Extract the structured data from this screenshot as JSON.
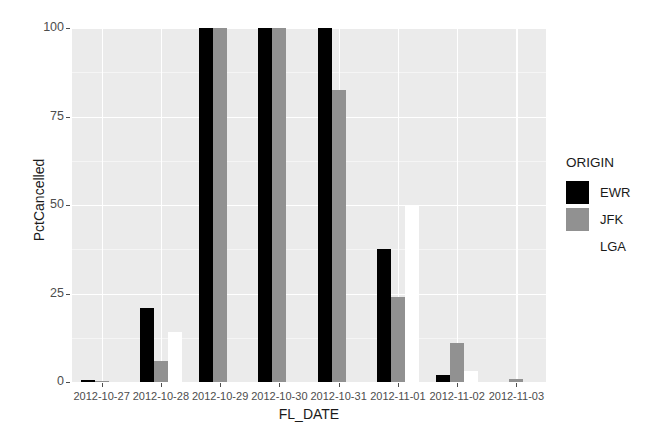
{
  "chart_data": {
    "type": "bar",
    "title": "",
    "subtitle": "",
    "xlabel": "FL_DATE",
    "ylabel": "PctCancelled",
    "ylim": [
      0,
      100
    ],
    "yticks": [
      0,
      25,
      50,
      75,
      100
    ],
    "ytick_labels": [
      "0",
      "25",
      "50",
      "75",
      "100"
    ],
    "grid": true,
    "grid_major_color": "#ffffff",
    "panel_background": "#ebebeb",
    "legend_position": "right",
    "legend_title": "ORIGIN",
    "categories": [
      "2012-10-27",
      "2012-10-28",
      "2012-10-29",
      "2012-10-30",
      "2012-10-31",
      "2012-11-01",
      "2012-11-02",
      "2012-11-03"
    ],
    "series": [
      {
        "name": "EWR",
        "color": "#000000",
        "values": [
          0.6,
          21,
          100,
          100,
          100,
          37.5,
          2,
          0
        ]
      },
      {
        "name": "JFK",
        "color": "#919191",
        "values": [
          0.4,
          6,
          100,
          100,
          82.5,
          24,
          11,
          0.8
        ]
      },
      {
        "name": "LGA",
        "color": "#ffffff",
        "values": [
          0,
          14,
          0,
          0,
          0,
          50,
          3,
          0
        ]
      }
    ]
  },
  "axes": {
    "y_title": "PctCancelled",
    "x_title": "FL_DATE"
  },
  "legend": {
    "title": "ORIGIN",
    "items": [
      {
        "label": "EWR",
        "color": "#000000"
      },
      {
        "label": "JFK",
        "color": "#919191"
      },
      {
        "label": "LGA",
        "color": "#ffffff"
      }
    ]
  }
}
